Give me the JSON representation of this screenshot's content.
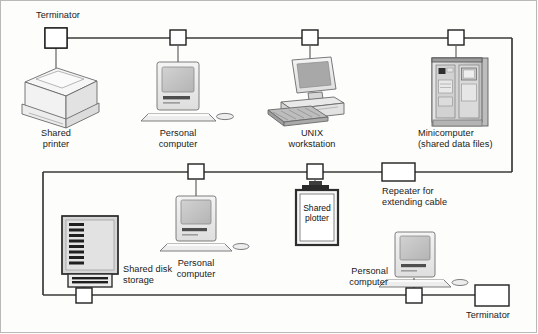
{
  "diagram": {
    "type": "network-topology",
    "colors": {
      "background": "#fdfdfc",
      "cable": "#3a3a3a",
      "outline": "#4a4a4a",
      "device_fill_light": "#efefef",
      "device_fill_mid": "#d8d8d8",
      "device_fill_dark": "#9a9a9a",
      "screen_fill": "#c6c6c6",
      "frame": "#b9b9b9",
      "text": "#1a1a1a"
    },
    "labels": {
      "terminator_top": "Terminator",
      "terminator_bottom": "Terminator",
      "shared_printer": "Shared\nprinter",
      "personal_computer_top": "Personal\ncomputer",
      "unix_workstation": "UNIX\nworkstation",
      "minicomputer": "Minicomputer\n(shared data files)",
      "repeater": "Repeater for\nextending cable",
      "personal_computer_middle": "Personal\ncomputer",
      "shared_plotter": "Shared\nplotter",
      "shared_disk_storage": "Shared disk\nstorage",
      "personal_computer_bottom": "Personal\ncomputer"
    },
    "nodes": [
      {
        "id": "terminator-top-left",
        "kind": "terminator",
        "label": "Terminator",
        "segment": "top",
        "x": 56,
        "y": 38
      },
      {
        "id": "tap-shared-printer",
        "kind": "tap",
        "device": "shared-printer",
        "segment": "top",
        "x": 56,
        "y": 38
      },
      {
        "id": "tap-personal-computer-top",
        "kind": "tap",
        "device": "personal-computer-top",
        "segment": "top",
        "x": 178,
        "y": 38
      },
      {
        "id": "tap-unix-workstation",
        "kind": "tap",
        "device": "unix-workstation",
        "segment": "top",
        "x": 310,
        "y": 38
      },
      {
        "id": "tap-minicomputer",
        "kind": "tap",
        "device": "minicomputer",
        "segment": "top",
        "x": 456,
        "y": 38
      },
      {
        "id": "repeater",
        "kind": "repeater",
        "label": "Repeater for extending cable",
        "segment": "middle",
        "x": 398,
        "y": 172
      },
      {
        "id": "tap-shared-plotter",
        "kind": "tap",
        "device": "shared-plotter",
        "segment": "middle",
        "x": 315,
        "y": 172
      },
      {
        "id": "tap-personal-computer-middle",
        "kind": "tap",
        "device": "personal-computer-middle",
        "segment": "middle",
        "x": 196,
        "y": 172
      },
      {
        "id": "tap-shared-disk-storage",
        "kind": "tap",
        "device": "shared-disk-storage",
        "segment": "bottom",
        "x": 84,
        "y": 295
      },
      {
        "id": "tap-personal-computer-bottom",
        "kind": "tap",
        "device": "personal-computer-bottom",
        "segment": "bottom",
        "x": 414,
        "y": 295
      },
      {
        "id": "terminator-bottom-right",
        "kind": "terminator",
        "label": "Terminator",
        "segment": "bottom",
        "x": 492,
        "y": 295
      }
    ],
    "devices": [
      {
        "id": "shared-printer",
        "label": "Shared\nprinter",
        "icon": "printer-icon"
      },
      {
        "id": "personal-computer-top",
        "label": "Personal\ncomputer",
        "icon": "desktop-computer-icon"
      },
      {
        "id": "unix-workstation",
        "label": "UNIX\nworkstation",
        "icon": "workstation-icon"
      },
      {
        "id": "minicomputer",
        "label": "Minicomputer\n(shared data files)",
        "icon": "minicomputer-cabinet-icon"
      },
      {
        "id": "personal-computer-middle",
        "label": "Personal\ncomputer",
        "icon": "desktop-computer-icon"
      },
      {
        "id": "shared-plotter",
        "label": "Shared\nplotter",
        "icon": "plotter-icon"
      },
      {
        "id": "shared-disk-storage",
        "label": "Shared disk\nstorage",
        "icon": "disk-array-icon"
      },
      {
        "id": "personal-computer-bottom",
        "label": "Personal\ncomputer",
        "icon": "desktop-computer-icon"
      }
    ],
    "cable_segments": [
      {
        "id": "segment-top",
        "y": 38,
        "from_x": 56,
        "to_x": 512
      },
      {
        "id": "segment-right-vertical",
        "x": 512,
        "from_y": 38,
        "to_y": 172
      },
      {
        "id": "segment-middle",
        "y": 172,
        "from_x": 43,
        "to_x": 512
      },
      {
        "id": "segment-left-vertical",
        "x": 43,
        "from_y": 172,
        "to_y": 295
      },
      {
        "id": "segment-bottom",
        "y": 295,
        "from_x": 43,
        "to_x": 492
      }
    ]
  }
}
